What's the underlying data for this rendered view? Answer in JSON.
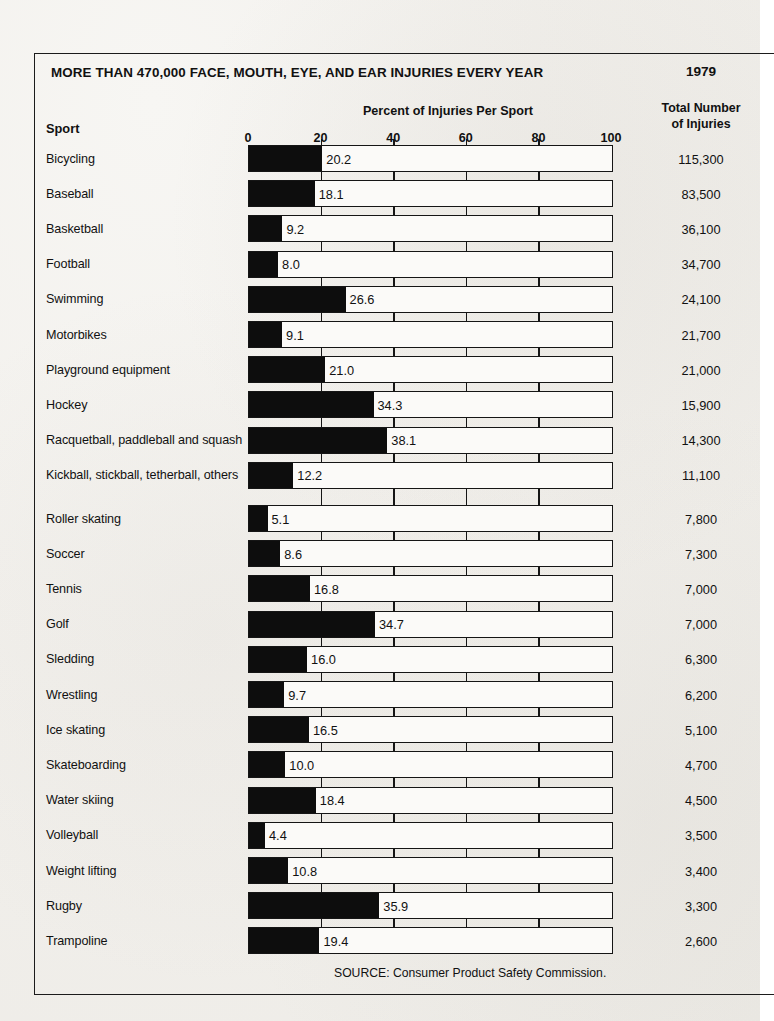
{
  "header": {
    "title": "MORE THAN 470,000 FACE, MOUTH, EYE, AND EAR INJURIES EVERY YEAR",
    "year": "1979",
    "percent_header": "Percent of Injuries Per Sport",
    "total_header_line1": "Total Number",
    "total_header_line2": "of Injuries",
    "sport_header": "Sport"
  },
  "source": "SOURCE: Consumer Product Safety Commission.",
  "colors": {
    "ink": "#0d0d0d",
    "paper": "#efedе9",
    "bar_fill": "#0d0d0d",
    "bar_track": "#fbfaf8"
  },
  "chart_data": {
    "type": "bar",
    "orientation": "horizontal",
    "title": "MORE THAN 470,000 FACE, MOUTH, EYE, AND EAR INJURIES EVERY YEAR",
    "subtitle": "1979",
    "xlabel": "Percent of Injuries Per Sport",
    "ylabel": "Sport",
    "xlim": [
      0,
      100
    ],
    "xticks": [
      0,
      20,
      40,
      60,
      80,
      100
    ],
    "xtick_labels": [
      "0",
      "20",
      "40",
      "60",
      "80",
      "100"
    ],
    "grid": false,
    "legend": false,
    "value_series_name": "Percent of Injuries Per Sport",
    "secondary_series_name": "Total Number of Injuries",
    "categories": [
      "Bicycling",
      "Baseball",
      "Basketball",
      "Football",
      "Swimming",
      "Motorbikes",
      "Playground equipment",
      "Hockey",
      "Racquetball, paddleball and squash",
      "Kickball, stickball, tetherball, others",
      "Roller skating",
      "Soccer",
      "Tennis",
      "Golf",
      "Sledding",
      "Wrestling",
      "Ice skating",
      "Skateboarding",
      "Water skiing",
      "Volleyball",
      "Weight lifting",
      "Rugby",
      "Trampoline"
    ],
    "values": [
      20.2,
      18.1,
      9.2,
      8.0,
      26.6,
      9.1,
      21.0,
      34.3,
      38.1,
      12.2,
      5.1,
      8.6,
      16.8,
      34.7,
      16.0,
      9.7,
      16.5,
      10.0,
      18.4,
      4.4,
      10.8,
      35.9,
      19.4
    ],
    "value_labels": [
      "20.2",
      "18.1",
      "9.2",
      "8.0",
      "26.6",
      "9.1",
      "21.0",
      "34.3",
      "38.1",
      "12.2",
      "5.1",
      "8.6",
      "16.8",
      "34.7",
      "16.0",
      "9.7",
      "16.5",
      "10.0",
      "18.4",
      "4.4",
      "10.8",
      "35.9",
      "19.4"
    ],
    "totals": [
      115300,
      83500,
      36100,
      34700,
      24100,
      21700,
      21000,
      15900,
      14300,
      11100,
      7800,
      7300,
      7000,
      7000,
      6300,
      6200,
      5100,
      4700,
      4500,
      3500,
      3400,
      3300,
      2600
    ],
    "total_labels": [
      "115,300",
      "83,500",
      "36,100",
      "34,700",
      "24,100",
      "21,700",
      "21,000",
      "15,900",
      "14,300",
      "11,100",
      "7,800",
      "7,300",
      "7,000",
      "7,000",
      "6,300",
      "6,200",
      "5,100",
      "4,700",
      "4,500",
      "3,500",
      "3,400",
      "3,300",
      "2,600"
    ]
  }
}
